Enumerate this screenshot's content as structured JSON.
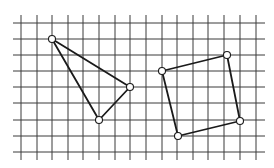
{
  "diagram": {
    "type": "grid-geometry",
    "background": "#ffffff",
    "grid": {
      "color": "#3a3a3a",
      "x_lines": [
        21,
        37,
        52,
        68,
        83,
        99,
        115,
        130,
        146,
        162,
        177,
        193,
        208,
        224,
        240,
        256
      ],
      "y_lines": [
        23,
        39,
        55,
        71,
        87,
        103,
        120,
        136,
        152
      ],
      "h_extent": [
        13,
        265
      ],
      "v_extent": [
        15,
        160
      ]
    },
    "shapes": [
      {
        "name": "triangle",
        "vertices": [
          [
            52,
            39
          ],
          [
            130,
            87
          ],
          [
            99,
            120
          ]
        ]
      },
      {
        "name": "quadrilateral",
        "vertices": [
          [
            162,
            71
          ],
          [
            227,
            55
          ],
          [
            240,
            121
          ],
          [
            178,
            136
          ]
        ]
      }
    ],
    "vertex_radius": 3.5
  }
}
